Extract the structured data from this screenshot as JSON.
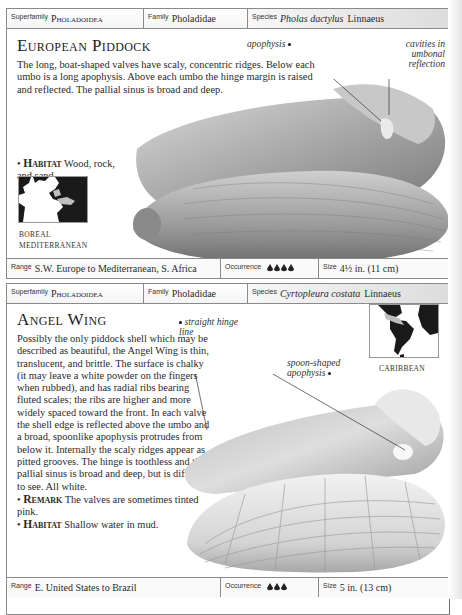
{
  "entries": [
    {
      "header": {
        "superfamily_label": "Superfamily",
        "superfamily": "Pholadoidea",
        "family_label": "Family",
        "family": "Pholadidae",
        "species_label": "Species",
        "species_name": "Pholas dactylus",
        "species_author": "Linnaeus"
      },
      "title": "European Piddock",
      "description": "The long, boat-shaped valves have scaly, concentric ridges. Below each umbo is a long apophysis. Above each umbo the hinge margin is raised and reflected. The pallial sinus is broad and deep.",
      "habitat_label": "Habitat",
      "habitat": "Wood, rock, and sand.",
      "map_labels": [
        "BOREAL",
        "MEDITERRANEAN"
      ],
      "annotations": [
        {
          "text": "apophysis"
        },
        {
          "text": "cavities in umbonal reflection"
        }
      ],
      "footer": {
        "range_label": "Range",
        "range": "S.W. Europe to Mediterranean, S. Africa",
        "occurrence_label": "Occurrence",
        "occurrence_count": 4,
        "size_label": "Size",
        "size": "4½ in. (11 cm)"
      }
    },
    {
      "header": {
        "superfamily_label": "Superfamily",
        "superfamily": "Pholadoidea",
        "family_label": "Family",
        "family": "Pholadidae",
        "species_label": "Species",
        "species_name": "Cyrtopleura costata",
        "species_author": "Linnaeus"
      },
      "title": "Angel Wing",
      "description": "Possibly the only piddock shell which may be described as beautiful, the Angel Wing is thin, translucent, and brittle. The surface is chalky (it may leave a white powder on the fingers when rubbed), and has radial ribs bearing fluted scales; the ribs are higher and more widely spaced toward the front. In each valve the shell edge is reflected above the umbo and a broad, spoonlike apophysis protrudes from below it. Internally the scaly ridges appear as pitted grooves. The hinge is toothless and the pallial sinus is broad and deep, but is difficult to see. All white.",
      "remark_label": "Remark",
      "remark": "The valves are sometimes tinted pink.",
      "habitat_label": "Habitat",
      "habitat": "Shallow water in mud.",
      "map_labels": [
        "CARIBBEAN"
      ],
      "annotations": [
        {
          "text": "straight hinge line"
        },
        {
          "text": "spoon-shaped apophysis"
        }
      ],
      "footer": {
        "range_label": "Range",
        "range": "E. United States to Brazil",
        "occurrence_label": "Occurrence",
        "occurrence_count": 3,
        "size_label": "Size",
        "size": "5 in. (13 cm)"
      }
    }
  ],
  "colors": {
    "border": "#8a8a8a",
    "text": "#2a2a2a",
    "header_gradient_end": "#dcdcdc"
  }
}
